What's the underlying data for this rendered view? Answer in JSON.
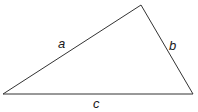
{
  "diagram": {
    "type": "triangle",
    "stroke_color": "#333333",
    "vertices": {
      "left": [
        3,
        94
      ],
      "top": [
        141,
        5
      ],
      "right": [
        193,
        94
      ]
    },
    "sides": [
      {
        "id": "a",
        "label": "a",
        "from": "left",
        "to": "top",
        "label_pos": [
          62,
          46
        ]
      },
      {
        "id": "b",
        "label": "b",
        "from": "top",
        "to": "right",
        "label_pos": [
          173,
          48
        ]
      },
      {
        "id": "c",
        "label": "c",
        "from": "left",
        "to": "right",
        "label_pos": [
          97,
          108
        ]
      }
    ]
  }
}
